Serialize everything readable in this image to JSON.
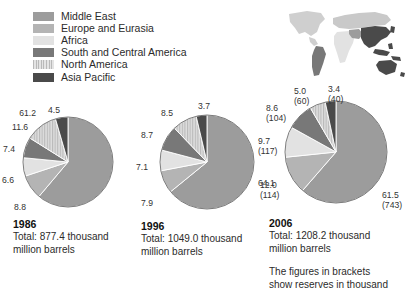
{
  "legend": {
    "items": [
      {
        "label": "Middle East",
        "color": "#9c9c9c",
        "pattern": "solid"
      },
      {
        "label": "Europe and Eurasia",
        "color": "#b4b4b4",
        "pattern": "solid"
      },
      {
        "label": "Africa",
        "color": "#e2e2e2",
        "pattern": "solid"
      },
      {
        "label": "South and Central America",
        "color": "#787878",
        "pattern": "solid"
      },
      {
        "label": "North America",
        "color": "#cfcfcf",
        "pattern": "stripe"
      },
      {
        "label": "Asia Pacific",
        "color": "#4a4a4a",
        "pattern": "solid"
      }
    ]
  },
  "chart_data": [
    {
      "type": "pie",
      "title": "1986",
      "total_label": "Total: 877.4 thousand million barrels",
      "categories": [
        "Middle East",
        "Europe and Eurasia",
        "Africa",
        "South and Central America",
        "North America",
        "Asia Pacific"
      ],
      "values": [
        61.2,
        8.8,
        6.6,
        7.4,
        11.6,
        4.5
      ],
      "labels": [
        "61.2",
        "8.8",
        "6.6",
        "7.4",
        "11.6",
        "4.5"
      ],
      "brackets": [
        "",
        "",
        "",
        "",
        "",
        ""
      ],
      "unit": "percent"
    },
    {
      "type": "pie",
      "title": "1996",
      "total_label": "Total: 1049.0 thousand million barrels",
      "categories": [
        "Middle East",
        "Europe and Eurasia",
        "Africa",
        "South and Central America",
        "North America",
        "Asia Pacific"
      ],
      "values": [
        64.1,
        7.9,
        7.1,
        8.7,
        8.5,
        3.7
      ],
      "labels": [
        "64.1",
        "7.9",
        "7.1",
        "8.7",
        "8.5",
        "3.7"
      ],
      "brackets": [
        "",
        "",
        "",
        "",
        "",
        ""
      ],
      "unit": "percent"
    },
    {
      "type": "pie",
      "title": "2006",
      "total_label": "Total: 1208.2 thousand million barrels",
      "categories": [
        "Middle East",
        "Europe and Eurasia",
        "Africa",
        "South and Central America",
        "North America",
        "Asia Pacific"
      ],
      "values": [
        61.5,
        12.0,
        9.7,
        8.6,
        5.0,
        3.4
      ],
      "labels": [
        "61.5",
        "12.0",
        "9.7",
        "8.6",
        "5.0",
        "3.4"
      ],
      "brackets": [
        "(743)",
        "(114)",
        "(117)",
        "(104)",
        "(60)",
        "(40)"
      ],
      "unit": "percent"
    }
  ],
  "charts": {
    "c1": {
      "year": "1986",
      "total_line1": "Total: 877.4 thousand",
      "total_line2": "million barrels"
    },
    "c2": {
      "year": "1996",
      "total_line1": "Total: 1049.0 thousand",
      "total_line2": "million barrels"
    },
    "c3": {
      "year": "2006",
      "total_line1": "Total: 1208.2 thousand",
      "total_line2": "million barrels",
      "footnote_line1": "The figures in brackets",
      "footnote_line2": "show reserves in thousand"
    }
  },
  "map": {
    "name": "world-map",
    "highlight_region": "Asia Pacific",
    "colors": {
      "asia_pacific": "#4a4a4a",
      "south_america": "#787878",
      "north_america": "#cfcfcf",
      "africa": "#e2e2e2",
      "europe_eurasia": "#c9c9c9",
      "middle_east": "#9c9c9c"
    }
  }
}
